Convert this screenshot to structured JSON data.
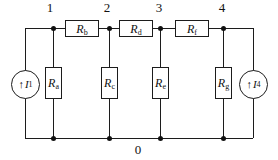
{
  "nodes": {
    "n1": "1",
    "n2": "2",
    "n3": "3",
    "n4": "4",
    "ground": "0"
  },
  "resistors": {
    "ra": {
      "symbol": "R",
      "subscript": "a"
    },
    "rb": {
      "symbol": "R",
      "subscript": "b"
    },
    "rc": {
      "symbol": "R",
      "subscript": "c"
    },
    "rd": {
      "symbol": "R",
      "subscript": "d"
    },
    "re": {
      "symbol": "R",
      "subscript": "e"
    },
    "rf": {
      "symbol": "R",
      "subscript": "f"
    },
    "rg": {
      "symbol": "R",
      "subscript": "g"
    }
  },
  "sources": {
    "i1": {
      "arrow": "↑",
      "symbol": "I",
      "subscript": "1"
    },
    "i4": {
      "arrow": "↑",
      "symbol": "I",
      "subscript": "4"
    }
  },
  "colors": {
    "line": "#1c1c1c",
    "background": "#ffffff"
  }
}
